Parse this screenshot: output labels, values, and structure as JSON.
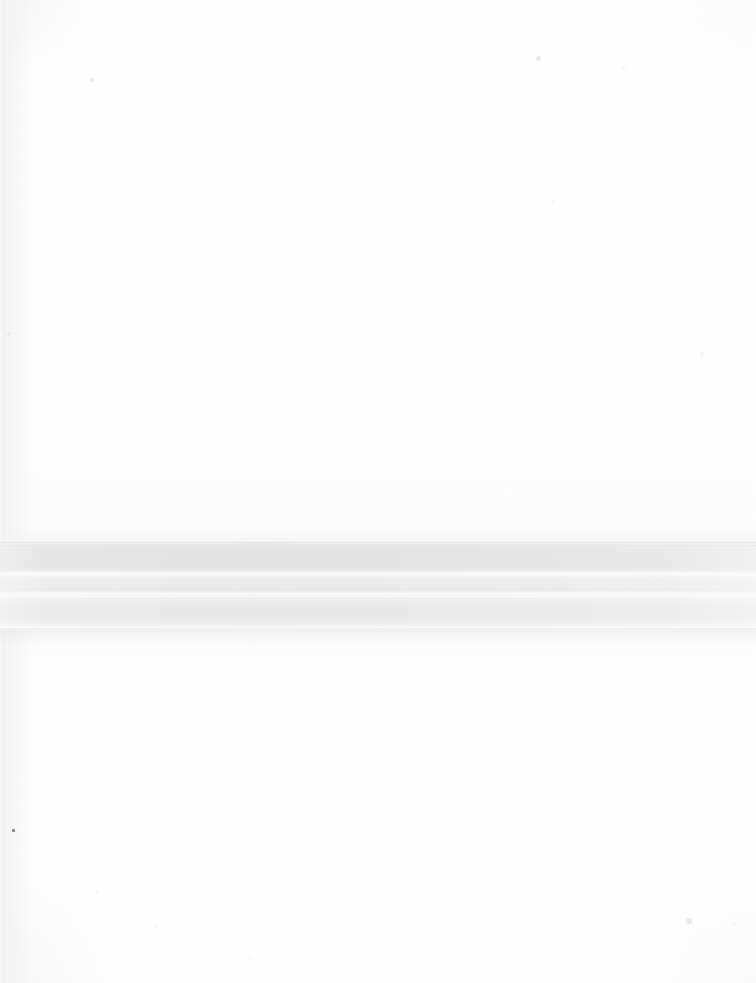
{
  "image": {
    "kind": "scanned-document-page",
    "description": "Scan of a blank sheet with a full-width horizontal grey shadow band across the lower-middle of the page",
    "width": 756,
    "height": 983,
    "orientation": "portrait",
    "text_content": "",
    "page_background_color": "#ffffff"
  },
  "regions": {
    "upper_blank": {
      "name": "upper blank paper area",
      "top": 0,
      "height": 542,
      "color": "#ffffff"
    },
    "shadow_band": {
      "name": "horizontal shadow band",
      "top": 542,
      "height": 86,
      "base_color": "#e7e7e7",
      "edge_color": "#e3e3e3",
      "highlight_color": "#fbfbfb",
      "spans_full_width": true,
      "highlight_lines": [
        {
          "name": "upper highlight line",
          "top": 573,
          "height": 2
        },
        {
          "name": "lower highlight line",
          "top": 593,
          "height": 2
        }
      ]
    },
    "lower_blank": {
      "name": "lower blank paper area",
      "top": 628,
      "height": 355,
      "color": "#ffffff"
    },
    "left_gutter": {
      "name": "left binding edge line",
      "left": 0,
      "width": 10,
      "color": "#f0f0f0"
    }
  },
  "artifacts": {
    "specks": [
      {
        "x": 12,
        "y": 829,
        "size": 3,
        "tone": "dark"
      },
      {
        "x": 90,
        "y": 78,
        "size": 4,
        "tone": "soft"
      },
      {
        "x": 536,
        "y": 56,
        "size": 5,
        "tone": "soft"
      },
      {
        "x": 686,
        "y": 918,
        "size": 6,
        "tone": "soft"
      },
      {
        "x": 733,
        "y": 922,
        "size": 3,
        "tone": "faint"
      },
      {
        "x": 95,
        "y": 890,
        "size": 3,
        "tone": "faint"
      },
      {
        "x": 155,
        "y": 924,
        "size": 3,
        "tone": "faint"
      },
      {
        "x": 248,
        "y": 958,
        "size": 2,
        "tone": "faint"
      },
      {
        "x": 375,
        "y": 947,
        "size": 2,
        "tone": "faint"
      },
      {
        "x": 166,
        "y": 921,
        "size": 2,
        "tone": "faint"
      },
      {
        "x": 60,
        "y": 618,
        "size": 3,
        "tone": "faint"
      },
      {
        "x": 252,
        "y": 594,
        "size": 2,
        "tone": "faint"
      },
      {
        "x": 549,
        "y": 554,
        "size": 3,
        "tone": "faint"
      },
      {
        "x": 673,
        "y": 630,
        "size": 2,
        "tone": "faint"
      },
      {
        "x": 330,
        "y": 566,
        "size": 2,
        "tone": "faint"
      },
      {
        "x": 452,
        "y": 564,
        "size": 2,
        "tone": "faint"
      },
      {
        "x": 7,
        "y": 332,
        "size": 4,
        "tone": "soft"
      },
      {
        "x": 700,
        "y": 352,
        "size": 4,
        "tone": "faint"
      },
      {
        "x": 552,
        "y": 200,
        "size": 3,
        "tone": "faint"
      },
      {
        "x": 622,
        "y": 66,
        "size": 3,
        "tone": "faint"
      }
    ]
  }
}
